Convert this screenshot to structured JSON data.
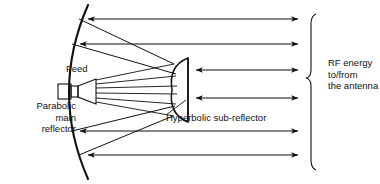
{
  "diagram": {
    "labels": {
      "feed": "Feed",
      "main_reflector": "Parabolic\nmain\nreflector",
      "sub_reflector": "Hyperbolic sub-reflector",
      "rf_energy": "RF energy\nto/from\nthe antenna"
    },
    "colors": {
      "ink": "#111111",
      "background": "#ffffff"
    },
    "geometry": {
      "parabola": {
        "vertex_x": 60,
        "vertex_y": 92,
        "top_x": 88,
        "top_y": 5,
        "bottom_x": 88,
        "bottom_y": 179,
        "opens": "right"
      },
      "feed_horn": {
        "waveguide_x": 58,
        "waveguide_y": 84,
        "waveguide_w": 14,
        "waveguide_h": 16,
        "mouth_x": 96,
        "mouth_half_height": 13
      },
      "sub_reflector": {
        "face_x": 172,
        "flat_x": 188,
        "center_y": 90,
        "half_height": 32
      },
      "horizontal_arrows": [
        {
          "y": 19,
          "x1": 88,
          "x2": 298
        },
        {
          "y": 44,
          "x1": 80,
          "x2": 298
        },
        {
          "y": 70,
          "x1": 196,
          "x2": 298
        },
        {
          "y": 98,
          "x1": 196,
          "x2": 298
        },
        {
          "y": 131,
          "x1": 80,
          "x2": 298
        },
        {
          "y": 155,
          "x1": 88,
          "x2": 298
        }
      ],
      "arrow_count": 6,
      "brace": {
        "x": 312,
        "top_y": 14,
        "bottom_y": 170,
        "tip_y": 78
      }
    }
  }
}
